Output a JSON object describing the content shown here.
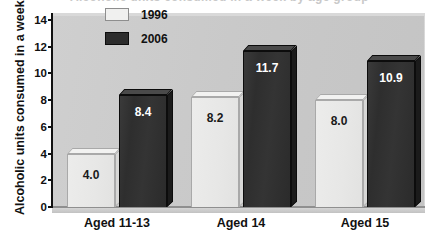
{
  "title_sliver": "Alcoholic units consumed in a week by age group",
  "chart_data": {
    "type": "bar",
    "title": "",
    "xlabel": "",
    "ylabel": "Alcoholic units consumed in a week",
    "categories": [
      "Aged 11-13",
      "Aged 14",
      "Aged 15"
    ],
    "series": [
      {
        "name": "1996",
        "values": [
          4.0,
          8.2,
          8.0
        ],
        "labels": [
          "4.0",
          "8.2",
          "8.0"
        ],
        "color": "#ececeb"
      },
      {
        "name": "2006",
        "values": [
          8.4,
          11.7,
          10.9
        ],
        "labels": [
          "8.4",
          "11.7",
          "10.9"
        ],
        "color": "#2e2e2e"
      }
    ],
    "ylim": [
      0,
      14
    ],
    "yticks": [
      0,
      2,
      4,
      6,
      8,
      10,
      12,
      14
    ],
    "ytick_labels": [
      "0",
      "2",
      "4",
      "6",
      "8",
      "10",
      "12",
      "14"
    ],
    "grid": false,
    "legend_position": "top-center",
    "style": "3d-column",
    "plot_background": "#c9c9c9"
  },
  "legend": {
    "entries": [
      {
        "label": "1996",
        "swatch": "legend-swatch-1996"
      },
      {
        "label": "2006",
        "swatch": "legend-swatch-2006"
      }
    ]
  }
}
